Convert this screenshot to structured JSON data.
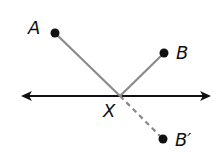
{
  "diagram": {
    "labels": {
      "A": "A",
      "B": "B",
      "X": "X",
      "B_prime": "B′"
    },
    "colors": {
      "line": "#111111",
      "segment": "#8a8a8a",
      "point": "#111111"
    },
    "points": {
      "A": [
        55,
        33
      ],
      "B": [
        164,
        53
      ],
      "X": [
        120,
        96
      ],
      "B_prime": [
        163,
        139
      ]
    }
  }
}
